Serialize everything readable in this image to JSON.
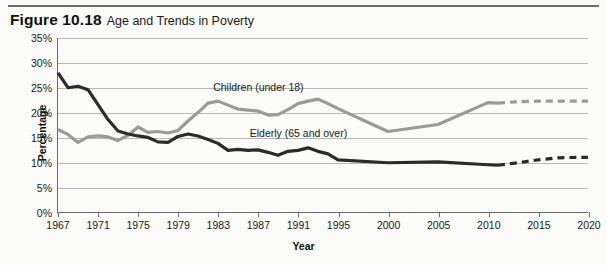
{
  "figure": {
    "number": "Figure 10.18",
    "title": "Age and Trends in Poverty"
  },
  "chart_data": {
    "type": "line",
    "title": "Age and Trends in Poverty",
    "xlabel": "Year",
    "ylabel": "Percentage",
    "xlim": [
      1967,
      2020
    ],
    "ylim": [
      0,
      35
    ],
    "ytick_labels": [
      "0%",
      "5%",
      "10%",
      "15%",
      "20%",
      "25%",
      "30%",
      "35%"
    ],
    "ytick_values": [
      0,
      5,
      10,
      15,
      20,
      25,
      30,
      35
    ],
    "xtick_labels": [
      "1967",
      "1971",
      "1975",
      "1979",
      "1983",
      "1987",
      "1991",
      "1995",
      "2000",
      "2005",
      "2010",
      "2015",
      "2020"
    ],
    "xtick_values": [
      1967,
      1971,
      1975,
      1979,
      1983,
      1987,
      1991,
      1995,
      2000,
      2005,
      2010,
      2015,
      2020
    ],
    "grid": true,
    "legend": "inline-annotations",
    "series": [
      {
        "name": "Children (under 18)",
        "color": "#9a9a9a",
        "style": "solid",
        "annotation": "Children (under 18)",
        "x": [
          1967,
          1968,
          1969,
          1970,
          1971,
          1972,
          1973,
          1974,
          1975,
          1976,
          1977,
          1978,
          1979,
          1980,
          1981,
          1982,
          1983,
          1984,
          1985,
          1986,
          1987,
          1988,
          1989,
          1990,
          1991,
          1992,
          1993,
          1994,
          1995,
          2000,
          2005,
          2010,
          2011
        ],
        "y": [
          16.6,
          15.6,
          14.0,
          15.1,
          15.3,
          15.1,
          14.4,
          15.4,
          17.1,
          16.0,
          16.2,
          15.9,
          16.4,
          18.3,
          20.0,
          21.9,
          22.3,
          21.5,
          20.7,
          20.5,
          20.3,
          19.5,
          19.6,
          20.6,
          21.8,
          22.3,
          22.7,
          21.8,
          20.8,
          16.2,
          17.6,
          22.0,
          21.9
        ]
      },
      {
        "name": "Children (under 18) projected",
        "color": "#9a9a9a",
        "style": "dashed",
        "x": [
          2011,
          2013,
          2015,
          2017,
          2019,
          2020
        ],
        "y": [
          21.9,
          22.2,
          22.3,
          22.3,
          22.3,
          22.3
        ]
      },
      {
        "name": "Elderly (65 and over)",
        "color": "#2b2b2b",
        "style": "solid",
        "annotation": "Elderly (65 and over)",
        "x": [
          1967,
          1968,
          1969,
          1970,
          1971,
          1972,
          1973,
          1974,
          1975,
          1976,
          1977,
          1978,
          1979,
          1980,
          1981,
          1982,
          1983,
          1984,
          1985,
          1986,
          1987,
          1988,
          1989,
          1990,
          1991,
          1992,
          1993,
          1994,
          1995,
          2000,
          2005,
          2010,
          2011
        ],
        "y": [
          28.0,
          25.0,
          25.3,
          24.6,
          21.6,
          18.6,
          16.3,
          15.7,
          15.3,
          15.0,
          14.1,
          14.0,
          15.2,
          15.7,
          15.3,
          14.6,
          13.8,
          12.4,
          12.6,
          12.4,
          12.5,
          12.0,
          11.4,
          12.2,
          12.4,
          12.9,
          12.2,
          11.7,
          10.5,
          9.9,
          10.1,
          9.5,
          9.4
        ]
      },
      {
        "name": "Elderly (65 and over) projected",
        "color": "#2b2b2b",
        "style": "dashed",
        "x": [
          2011,
          2013,
          2015,
          2017,
          2019,
          2020
        ],
        "y": [
          9.4,
          9.9,
          10.5,
          10.9,
          11.0,
          11.0
        ]
      }
    ],
    "annotations": [
      {
        "text": "Children (under 18)",
        "x": 1987,
        "y": 25.2
      },
      {
        "text": "Elderly (65 and over)",
        "x": 1991,
        "y": 16.1
      }
    ]
  },
  "colors": {
    "children_line": "#9a9a9a",
    "elderly_line": "#2b2b2b",
    "gridline": "#b9b9b9",
    "axis": "#6b6b6b",
    "background": "#fbfbf9"
  }
}
